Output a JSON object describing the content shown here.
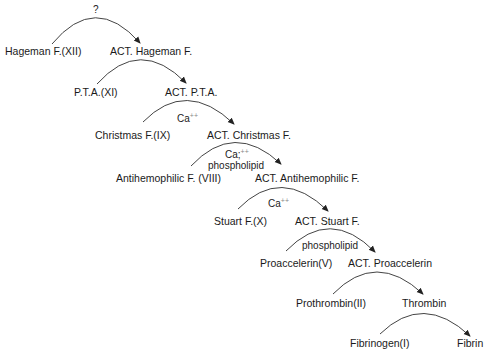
{
  "diagram": {
    "type": "coagulation-cascade",
    "steps": [
      {
        "from": "Hageman F.(XII)",
        "to": "ACT. Hageman F.",
        "catalyst": "?",
        "catalyst_sup": "",
        "catalyst2": ""
      },
      {
        "from": "P.T.A.(XI)",
        "to": "ACT. P.T.A.",
        "catalyst": "",
        "catalyst_sup": "",
        "catalyst2": ""
      },
      {
        "from": "Christmas F.(IX)",
        "to": "ACT. Christmas F.",
        "catalyst": "Ca",
        "catalyst_sup": "++",
        "catalyst2": ""
      },
      {
        "from": "Antihemophilic F. (VIII)",
        "to": "ACT. Antihemophilic F.",
        "catalyst": "Ca;",
        "catalyst_sup": "++",
        "catalyst2": "phospholipid"
      },
      {
        "from": "Stuart F.(X)",
        "to": "ACT. Stuart F.",
        "catalyst": "Ca",
        "catalyst_sup": "++",
        "catalyst2": ""
      },
      {
        "from": "Proaccelerin(V)",
        "to": "ACT. Proaccelerin",
        "catalyst": "",
        "catalyst_sup": "",
        "catalyst2": "phospholipid"
      },
      {
        "from": "Prothrombin(II)",
        "to": "Thrombin",
        "catalyst": "",
        "catalyst_sup": "",
        "catalyst2": ""
      },
      {
        "from": "Fibrinogen(I)",
        "to": "Fibrin",
        "catalyst": "",
        "catalyst_sup": "",
        "catalyst2": ""
      }
    ],
    "colors": {
      "text": "#1a1a1a",
      "arc": "#333333",
      "superscript": "#888888"
    }
  }
}
